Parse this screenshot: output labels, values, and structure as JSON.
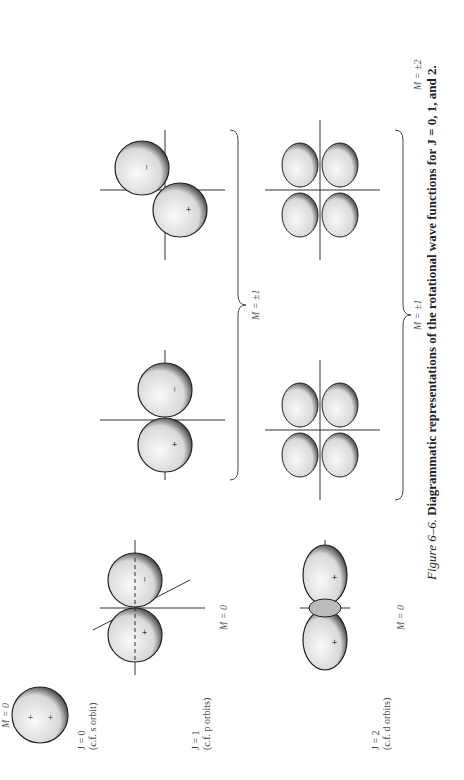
{
  "figure": {
    "number_label": "Figure 6–6.",
    "caption_text": "Diagrammatic representations of the rotational wave functions for J = 0, 1, and 2."
  },
  "rows": [
    {
      "j_label": "J = 0",
      "analogy": "(c.f. s orbit)",
      "groups": [
        {
          "m_label": "M = 0",
          "shapes": [
            "sphere"
          ]
        }
      ]
    },
    {
      "j_label": "J = 1",
      "analogy": "(c.f. p orbits)",
      "groups": [
        {
          "m_label": "M = 0",
          "shapes": [
            "dumbbell-axial"
          ]
        },
        {
          "m_label": "M = ±1",
          "shapes": [
            "dumbbell-tilted-a",
            "dumbbell-tilted-b"
          ]
        }
      ]
    },
    {
      "j_label": "J = 2",
      "analogy": "(c.f. d orbits)",
      "groups": [
        {
          "m_label": "M = 0",
          "shapes": [
            "dz2"
          ]
        },
        {
          "m_label": "M = ±1",
          "shapes": [
            "cloverleaf-a",
            "cloverleaf-b"
          ]
        },
        {
          "m_label": "M = ±2",
          "shapes": [
            "cloverleaf-c",
            "cloverleaf-d"
          ]
        }
      ]
    }
  ],
  "signs": {
    "plus": "+",
    "minus": "−"
  },
  "colors": {
    "ink": "#222222",
    "shade": "#555555",
    "paper": "#ffffff"
  }
}
